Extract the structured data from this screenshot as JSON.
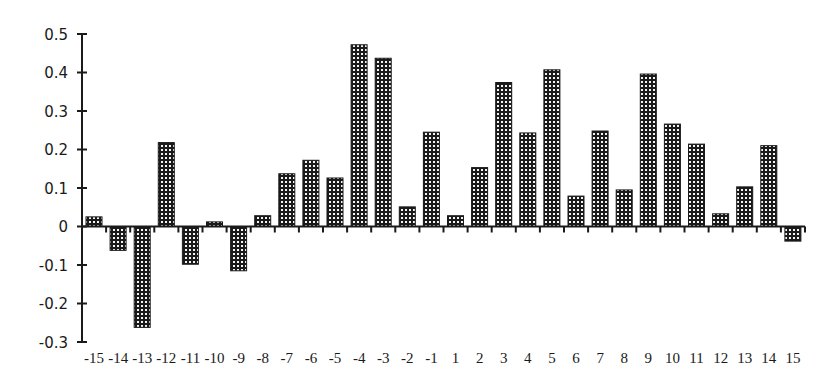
{
  "chart_data": {
    "type": "bar",
    "title": "",
    "xlabel": "",
    "ylabel": "",
    "categories": [
      "-15",
      "-14",
      "-13",
      "-12",
      "-11",
      "-10",
      "-9",
      "-8",
      "-7",
      "-6",
      "-5",
      "-4",
      "-3",
      "-2",
      "-1",
      "1",
      "2",
      "3",
      "4",
      "5",
      "6",
      "7",
      "8",
      "9",
      "10",
      "11",
      "12",
      "13",
      "14",
      "15"
    ],
    "values": [
      0.025,
      -0.062,
      -0.262,
      0.218,
      -0.098,
      0.012,
      -0.115,
      0.028,
      0.137,
      0.172,
      0.126,
      0.472,
      0.437,
      0.051,
      0.245,
      0.028,
      0.153,
      0.374,
      0.243,
      0.407,
      0.079,
      0.248,
      0.095,
      0.396,
      0.266,
      0.214,
      0.033,
      0.103,
      0.21,
      -0.038
    ],
    "ylim": [
      -0.3,
      0.5
    ],
    "yticks": [
      "0.5",
      "0.4",
      "0.3",
      "0.2",
      "0.1",
      "0",
      "-0.1",
      "-0.2",
      "-0.3"
    ],
    "ytick_values": [
      0.5,
      0.4,
      0.3,
      0.2,
      0.1,
      0,
      -0.1,
      -0.2,
      -0.3
    ],
    "grid": false,
    "legend": null,
    "bar_style": "dark fill with white dot pattern",
    "colors": {
      "bar_fill": "#1a1a1a",
      "bar_dots": "#ffffff",
      "axis": "#1a1a1a",
      "background": "#ffffff"
    }
  }
}
